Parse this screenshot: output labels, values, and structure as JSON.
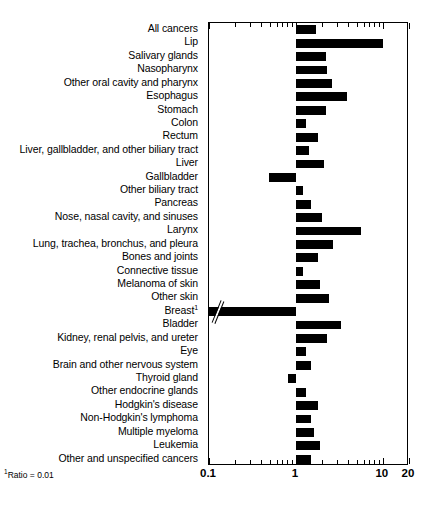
{
  "chart_data": {
    "type": "bar",
    "orientation": "horizontal",
    "scale": "log",
    "title": "",
    "xlabel": "",
    "ylabel": "",
    "xlim": [
      0.1,
      20
    ],
    "grid": false,
    "legend": null,
    "baseline": 1,
    "tick_labels": [
      {
        "value": 0.1,
        "label": "0.1"
      },
      {
        "value": 1,
        "label": "1"
      },
      {
        "value": 10,
        "label": "10"
      },
      {
        "value": 20,
        "label": "20"
      }
    ],
    "minor_ticks": [
      0.2,
      0.3,
      0.4,
      0.5,
      0.6,
      0.7,
      0.8,
      0.9,
      2,
      3,
      4,
      5,
      6,
      7,
      8,
      9,
      20
    ],
    "footnote": "Ratio = 0.01",
    "footnote_marker": "1",
    "categories": [
      "All cancers",
      "Lip",
      "Salivary glands",
      "Nasopharynx",
      "Other oral cavity and pharynx",
      "Esophagus",
      "Stomach",
      "Colon",
      "Rectum",
      "Liver, gallbladder, and other biliary tract",
      "Liver",
      "Gallbladder",
      "Other  biliary tract",
      "Pancreas",
      "Nose, nasal cavity, and sinuses",
      "Larynx",
      "Lung, trachea, bronchus, and pleura",
      "Bones and joints",
      "Connective tissue",
      "Melanoma of skin",
      "Other skin",
      "Breast",
      "Bladder",
      "Kidney, renal pelvis, and ureter",
      "Eye",
      "Brain and other nervous system",
      "Thyroid gland",
      "Other endocrine glands",
      "Hodgkin's disease",
      "Non-Hodgkin's lymphoma",
      "Multiple myeloma",
      "Leukemia",
      "Other and unspecified cancers"
    ],
    "values": [
      1.7,
      10.0,
      2.2,
      2.3,
      2.6,
      3.9,
      2.2,
      1.3,
      1.8,
      1.4,
      2.1,
      0.49,
      1.2,
      1.5,
      2.0,
      5.6,
      2.7,
      1.8,
      1.2,
      1.9,
      2.4,
      0.01,
      3.3,
      2.3,
      1.3,
      1.5,
      0.82,
      1.3,
      1.8,
      1.5,
      1.6,
      1.9,
      1.5
    ],
    "footnote_categories": [
      "Breast"
    ],
    "break_axis_rows": [
      "Breast"
    ]
  }
}
